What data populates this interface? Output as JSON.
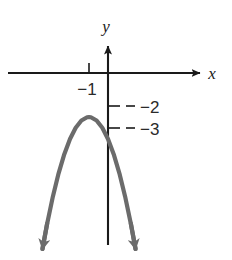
{
  "figure": {
    "width": 232,
    "height": 260,
    "background_color": "#ffffff",
    "axis_color": "#1a1a1a",
    "curve_color": "#6b6b6b",
    "label_color": "#2a2a2a",
    "top_faint_text": ""
  },
  "axes": {
    "x_label": "x",
    "y_label": "y",
    "x_axis_y_pixel": 73,
    "y_axis_x_pixel": 108,
    "unit_x_pixels": 19,
    "unit_y_pixels": 22,
    "x_arrow": true,
    "y_arrow": true
  },
  "ticks": {
    "x": [
      {
        "label": "−1",
        "value": -1
      }
    ],
    "y": [
      {
        "label": "−2",
        "value": -2,
        "has_leader_dash": true
      },
      {
        "label": "−3",
        "value": -3,
        "has_leader_dash": true
      }
    ]
  },
  "chart_data": {
    "type": "line",
    "title": "",
    "xlabel": "x",
    "ylabel": "y",
    "grid": false,
    "legend": null,
    "xlim": [
      -5.3,
      5.0
    ],
    "ylim": [
      -8.5,
      1.3
    ],
    "series": [
      {
        "name": "parabola",
        "equation": "y = -(x + 1)^2 - 2",
        "vertex": [
          -1,
          -2
        ],
        "opens": "down",
        "y_intercept": [
          0,
          -3
        ],
        "color": "#6b6b6b",
        "arrow_ends": "both",
        "x": [
          -3.45,
          -3.2,
          -2.9,
          -2.6,
          -2.3,
          -2.0,
          -1.7,
          -1.4,
          -1.1,
          -1.0,
          -0.9,
          -0.6,
          -0.3,
          0.0,
          0.3,
          0.6,
          0.9,
          1.2,
          1.45
        ],
        "y": [
          -8.0,
          -6.84,
          -5.61,
          -4.56,
          -3.69,
          -3.0,
          -2.49,
          -2.16,
          -2.01,
          -2.0,
          -2.01,
          -2.16,
          -2.49,
          -3.0,
          -3.69,
          -4.56,
          -5.61,
          -6.84,
          -8.0
        ]
      }
    ],
    "annotations": [
      {
        "text": "−1",
        "axis": "x",
        "value": -1
      },
      {
        "text": "−2",
        "axis": "y",
        "value": -2
      },
      {
        "text": "−3",
        "axis": "y",
        "value": -3
      }
    ]
  }
}
